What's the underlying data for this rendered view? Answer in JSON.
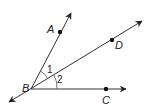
{
  "diagram": {
    "type": "geometry-angles",
    "vertex": {
      "label": "B",
      "x": 31,
      "y": 89
    },
    "rays": [
      {
        "name": "BA",
        "point_label": "A",
        "point": [
          60,
          32
        ],
        "tip": [
          71,
          13
        ],
        "label_pos": [
          48,
          33
        ]
      },
      {
        "name": "BD",
        "point_label": "D",
        "point": [
          112,
          40
        ],
        "tip": [
          142,
          21
        ],
        "label_pos": [
          116,
          49
        ]
      },
      {
        "name": "BC",
        "point_label": "C",
        "point": [
          106,
          89
        ],
        "tip": [
          126,
          89
        ],
        "label_pos": [
          102,
          104
        ]
      }
    ],
    "opposite_ray_tip": [
      9,
      102
    ],
    "angles": [
      {
        "label": "1",
        "between": "BA-BD",
        "label_pos": [
          47,
          73
        ]
      },
      {
        "label": "2",
        "between": "BD-BC",
        "label_pos": [
          57,
          83
        ]
      }
    ],
    "labels": {
      "A": "A",
      "B": "B",
      "C": "C",
      "D": "D",
      "angle1": "1",
      "angle2": "2"
    },
    "colors": {
      "line": "#333333",
      "point": "#111111",
      "arc": "#555555"
    }
  }
}
